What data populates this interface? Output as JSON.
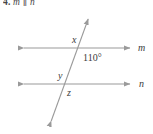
{
  "header": {
    "problem_number": "4.",
    "statement": "m ∥ n"
  },
  "figure": {
    "line_color": "#9a9a9a",
    "text_color": "#3a3a3a",
    "background": "#ffffff",
    "labels": {
      "angle_x": "x",
      "angle_given": "110°",
      "angle_y": "y",
      "angle_z": "z",
      "line_m": "m",
      "line_n": "n"
    },
    "geometry": {
      "line_m": {
        "x1": 18,
        "y1": 48,
        "x2": 136,
        "y2": 48,
        "arrows": "both"
      },
      "line_n": {
        "x1": 18,
        "y1": 84,
        "x2": 136,
        "y2": 84,
        "arrows": "both"
      },
      "transversal": {
        "x1": 49,
        "y1": 127,
        "x2": 90,
        "y2": 13,
        "arrows": "both"
      },
      "intersection_upper": {
        "x": 81,
        "y": 48
      },
      "intersection_lower": {
        "x": 68,
        "y": 84
      }
    }
  }
}
